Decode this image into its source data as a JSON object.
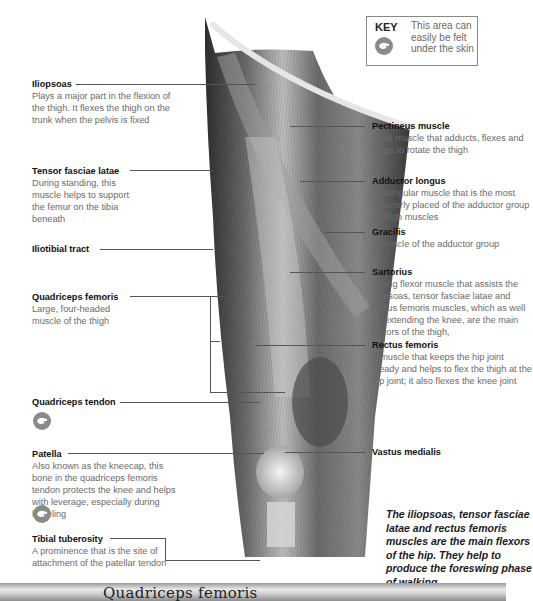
{
  "key": {
    "title": "KEY",
    "icon": "palpable-hand-icon",
    "text": "This area can easily be felt under the skin"
  },
  "labels_left": [
    {
      "title": "Iliopsoas",
      "desc": "Plays a major part in the flexion of the thigh. It flexes the thigh on the trunk when the pelvis is fixed"
    },
    {
      "title": "Tensor fasciae latae",
      "desc": "During standing, this muscle helps to support the femur on the tibia beneath"
    },
    {
      "title": "Iliotibial tract",
      "desc": ""
    },
    {
      "title": "Quadriceps femoris",
      "desc": "Large, four-headed muscle of the thigh"
    },
    {
      "title": "Quadriceps tendon",
      "desc": "",
      "palpable": true
    },
    {
      "title": "Patella",
      "desc": "Also known as the kneecap, this bone in the quadriceps femoris tendon protects the knee and helps with leverage, especially during kneeling",
      "palpable": true
    },
    {
      "title": "Tibial tuberosity",
      "desc": "A prominence that is the site of attachment of the patellar tendon"
    }
  ],
  "labels_right": [
    {
      "title": "Pectineus muscle",
      "desc": "A flat muscle that adducts, flexes and helps to rotate the thigh"
    },
    {
      "title": "Adductor longus",
      "desc": "A triangular muscle that is the most anteriorly placed of the adductor group of thigh muscles"
    },
    {
      "title": "Gracilis",
      "desc": "A muscle of the adductor group"
    },
    {
      "title": "Sartorius",
      "desc": "A long flexor muscle that assists the iliopsoas, tensor fasciae latae and rectus femoris muscles, which as well as extending the knee, are the main flexors of the thigh,"
    },
    {
      "title": "Rectus femoris",
      "desc": "A muscle that keeps the hip joint steady and helps to flex the thigh at the hip joint; it also flexes the knee joint"
    },
    {
      "title": "Vastus medialis",
      "desc": ""
    }
  ],
  "note": "The iliopsoas, tensor fasciae latae and rectus femoris muscles are the main flexors of the hip. They help to produce the foreswing phase of walking.",
  "banner": {
    "title": "Quadriceps femoris"
  },
  "colors": {
    "muscle_dark": "#3a3a3a",
    "muscle_mid": "#7a7a7a",
    "muscle_light": "#d0d0d0",
    "text_desc": "#6a6a6a"
  }
}
